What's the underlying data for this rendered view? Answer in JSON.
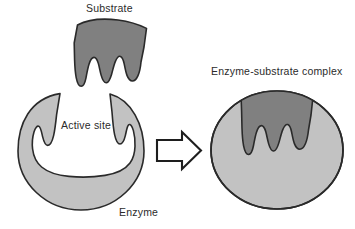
{
  "figure": {
    "width": 355,
    "height": 229,
    "background_color": "#ffffff"
  },
  "labels": {
    "substrate": "Substrate",
    "enzyme_substrate_complex": "Enzyme-substrate complex",
    "active_site": "Active site",
    "enzyme": "Enzyme"
  },
  "colors": {
    "substrate_fill": "#808080",
    "enzyme_fill": "#c2c2c2",
    "outline": "#2a2a2a",
    "text": "#2b2b2b",
    "arrow_fill": "#ffffff",
    "background": "#ffffff"
  },
  "shapes": {
    "substrate": {
      "name": "substrate",
      "fill": "#808080",
      "prong_count": 3
    },
    "enzyme_left": {
      "name": "enzyme-with-open-active-site",
      "fill": "#c2c2c2",
      "cx": 81,
      "cy": 151,
      "rx": 63,
      "ry": 59
    },
    "arrow": {
      "name": "reaction-arrow",
      "direction": "right",
      "fill": "#ffffff",
      "stroke": "#2a2a2a"
    },
    "complex": {
      "name": "enzyme-substrate-complex",
      "enzyme_fill": "#c2c2c2",
      "substrate_fill": "#808080",
      "cx": 277,
      "cy": 150,
      "rx": 66,
      "ry": 59
    }
  }
}
